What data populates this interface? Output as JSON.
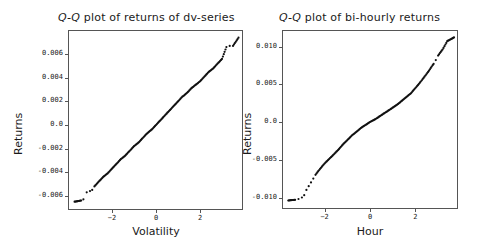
{
  "chart_data": [
    {
      "type": "scatter",
      "title": "Q-Q plot of returns of dv-series",
      "title_italic_prefix": "Q-Q",
      "title_rest": " plot of returns of dv-series",
      "xlabel": "Volatility",
      "ylabel": "Returns",
      "xticks": [
        "-2",
        "0",
        "2"
      ],
      "yticks": [
        "0.006",
        "0.004",
        "0.002",
        "0.0",
        "-0.002",
        "-0.004",
        "-0.006"
      ],
      "xlim": [
        -4.0,
        4.0
      ],
      "ylim": [
        -0.0068,
        0.0077
      ],
      "grid": false,
      "shape": "near-linear",
      "points": [
        [
          -3.7,
          -0.0065
        ],
        [
          -3.4,
          -0.0064
        ],
        [
          -3.3,
          -0.0063
        ],
        [
          -3.15,
          -0.0057
        ],
        [
          -3.0,
          -0.0056
        ],
        [
          -2.9,
          -0.0055
        ],
        [
          -2.8,
          -0.0052
        ],
        [
          -2.6,
          -0.0048
        ],
        [
          -2.4,
          -0.0044
        ],
        [
          -2.2,
          -0.0041
        ],
        [
          -2.0,
          -0.0037
        ],
        [
          -1.8,
          -0.0033
        ],
        [
          -1.6,
          -0.0029
        ],
        [
          -1.4,
          -0.0026
        ],
        [
          -1.2,
          -0.0022
        ],
        [
          -1.0,
          -0.0018
        ],
        [
          -0.8,
          -0.0015
        ],
        [
          -0.6,
          -0.0011
        ],
        [
          -0.4,
          -0.0007
        ],
        [
          -0.2,
          -0.0004
        ],
        [
          0.0,
          0.0
        ],
        [
          0.2,
          0.0004
        ],
        [
          0.4,
          0.0008
        ],
        [
          0.6,
          0.0012
        ],
        [
          0.8,
          0.0016
        ],
        [
          1.0,
          0.002
        ],
        [
          1.2,
          0.0024
        ],
        [
          1.4,
          0.0027
        ],
        [
          1.6,
          0.0031
        ],
        [
          1.8,
          0.0034
        ],
        [
          2.0,
          0.0037
        ],
        [
          2.2,
          0.0041
        ],
        [
          2.4,
          0.0045
        ],
        [
          2.6,
          0.0048
        ],
        [
          2.8,
          0.0052
        ],
        [
          3.0,
          0.0056
        ],
        [
          3.2,
          0.0066
        ],
        [
          3.35,
          0.0067
        ],
        [
          3.5,
          0.0067
        ],
        [
          3.75,
          0.0074
        ]
      ]
    },
    {
      "type": "scatter",
      "title": "Q-Q plot of bi-hourly returns",
      "title_italic_prefix": "Q-Q",
      "title_rest": " plot of bi-hourly returns",
      "xlabel": "Hour",
      "ylabel": "Returns",
      "xticks": [
        "-2",
        "0",
        "2"
      ],
      "yticks": [
        "0.010",
        "0.005",
        "0.0",
        "-0.005",
        "-0.010"
      ],
      "xlim": [
        -3.9,
        3.9
      ],
      "ylim": [
        -0.0115,
        0.0122
      ],
      "grid": false,
      "shape": "S-curve (heavy tails)",
      "points": [
        [
          -3.6,
          -0.0104
        ],
        [
          -3.3,
          -0.0103
        ],
        [
          -3.15,
          -0.0102
        ],
        [
          -3.0,
          -0.01
        ],
        [
          -2.9,
          -0.0097
        ],
        [
          -2.8,
          -0.009
        ],
        [
          -2.7,
          -0.0085
        ],
        [
          -2.6,
          -0.008
        ],
        [
          -2.5,
          -0.0075
        ],
        [
          -2.4,
          -0.007
        ],
        [
          -2.2,
          -0.0062
        ],
        [
          -2.0,
          -0.0055
        ],
        [
          -1.8,
          -0.0049
        ],
        [
          -1.6,
          -0.0043
        ],
        [
          -1.4,
          -0.0037
        ],
        [
          -1.2,
          -0.003
        ],
        [
          -1.0,
          -0.0024
        ],
        [
          -0.8,
          -0.0018
        ],
        [
          -0.6,
          -0.0013
        ],
        [
          -0.4,
          -0.0008
        ],
        [
          -0.2,
          -0.0004
        ],
        [
          0.0,
          0.0
        ],
        [
          0.2,
          0.0003
        ],
        [
          0.4,
          0.0007
        ],
        [
          0.6,
          0.0011
        ],
        [
          0.8,
          0.0015
        ],
        [
          1.0,
          0.0019
        ],
        [
          1.2,
          0.0023
        ],
        [
          1.4,
          0.0028
        ],
        [
          1.6,
          0.0033
        ],
        [
          1.8,
          0.0038
        ],
        [
          2.0,
          0.0045
        ],
        [
          2.2,
          0.0052
        ],
        [
          2.4,
          0.006
        ],
        [
          2.6,
          0.0068
        ],
        [
          2.8,
          0.0077
        ],
        [
          2.9,
          0.0082
        ],
        [
          3.0,
          0.0088
        ],
        [
          3.2,
          0.0096
        ],
        [
          3.4,
          0.0107
        ],
        [
          3.7,
          0.0112
        ]
      ]
    }
  ]
}
